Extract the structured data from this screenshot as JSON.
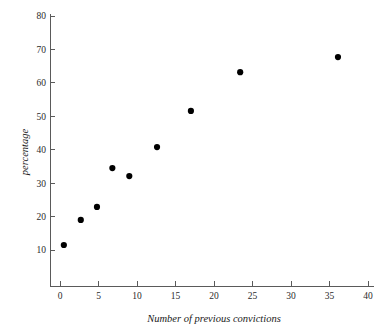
{
  "chart_data": {
    "type": "scatter",
    "title": "",
    "xlabel": "Number of previous convictions",
    "ylabel": "percentage",
    "xlim": [
      0,
      40
    ],
    "ylim": [
      0,
      80
    ],
    "xticks": [
      0,
      5,
      10,
      15,
      20,
      25,
      30,
      35,
      40
    ],
    "yticks": [
      10,
      20,
      30,
      40,
      50,
      60,
      70,
      80
    ],
    "xtick_labels": [
      "0",
      "5",
      "10",
      "15",
      "20",
      "25",
      "30",
      "35",
      "40"
    ],
    "ytick_labels": [
      "10",
      "20",
      "30",
      "40",
      "50",
      "60",
      "70",
      "80"
    ],
    "grid": false,
    "legend": false,
    "marker": "filled-circle",
    "marker_color": "#000000",
    "axis_color": "#5a5a5a",
    "background_color": "#ffffff",
    "points": [
      {
        "x": 0.5,
        "y": 11.5
      },
      {
        "x": 2.7,
        "y": 19.0
      },
      {
        "x": 4.8,
        "y": 22.9
      },
      {
        "x": 6.8,
        "y": 34.5
      },
      {
        "x": 9.0,
        "y": 32.1
      },
      {
        "x": 12.6,
        "y": 40.8
      },
      {
        "x": 17.0,
        "y": 51.6
      },
      {
        "x": 23.4,
        "y": 63.2
      },
      {
        "x": 36.1,
        "y": 67.7
      }
    ],
    "x": [
      0.5,
      2.7,
      4.8,
      6.8,
      9.0,
      12.6,
      17.0,
      23.4,
      36.1
    ],
    "values": [
      11.5,
      19.0,
      22.9,
      34.5,
      32.1,
      40.8,
      51.6,
      63.2,
      67.7
    ]
  }
}
